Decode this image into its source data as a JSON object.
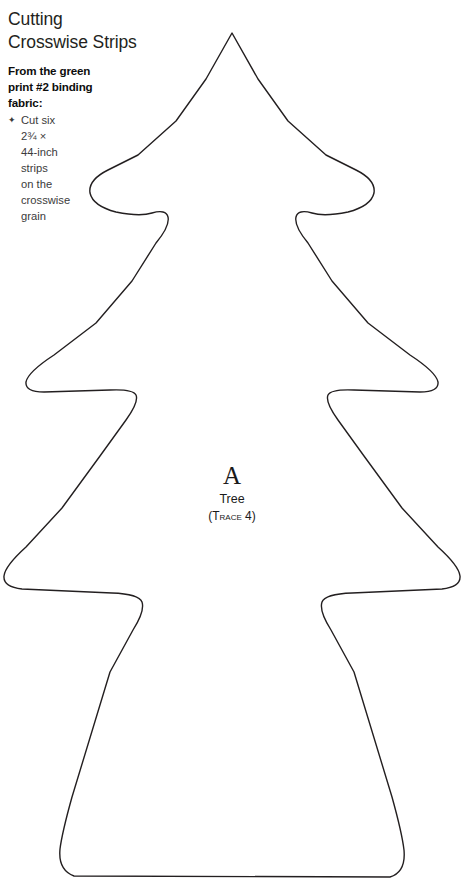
{
  "page": {
    "background_color": "#ffffff",
    "ink_color": "#231f20",
    "width": 464,
    "height": 885
  },
  "instructions": {
    "heading_lines": [
      "Cutting",
      "Crosswise Strips"
    ],
    "lead_lines": [
      "From the green",
      "print #2 binding",
      "fabric:"
    ],
    "bullets": [
      {
        "glyph": "✦",
        "lines": [
          "Cut six",
          "2¾ ×",
          "44-inch",
          "strips",
          "on the",
          "crosswise",
          "grain"
        ]
      }
    ]
  },
  "pattern": {
    "shape_name": "christmas-tree-template",
    "label_letter": "A",
    "label_name": "Tree",
    "label_trace": "(Trace 4)",
    "outline_color": "#231f20",
    "fill_color": "#ffffff",
    "stroke_width": 1.4,
    "path": "M232 33 L206 79 L176 121 L138 155 L108 170 Q88 180 90 193 Q93 206 116 212 Q140 217 152 213 Q166 209 168 217 Q170 226 156 243 L132 281 L96 323 L54 355 Q28 372 26 382 Q25 392 44 392 L110 390 Q133 389 136 395 Q139 402 126 420 L100 456 L62 508 L26 547 Q5 566 4 576 Q3 587 22 589 L112 593 Q139 594 142 602 Q145 611 133 630 L110 672 L72 797 Q62 833 60 849 Q58 870 74 876 L390 877 Q406 872 404 850 Q402 833 392 797 L354 672 L331 630 Q319 611 322 602 Q325 594 352 593 L442 589 Q461 587 460 576 Q459 566 438 547 L402 508 L364 456 L338 420 Q325 402 328 395 Q331 389 354 390 L420 392 Q439 392 438 382 Q436 372 410 355 L368 323 L332 281 L308 243 Q294 226 296 217 Q298 209 312 213 Q324 217 348 212 Q371 206 374 193 Q376 180 356 170 L326 155 L288 121 L258 79 Z"
  }
}
